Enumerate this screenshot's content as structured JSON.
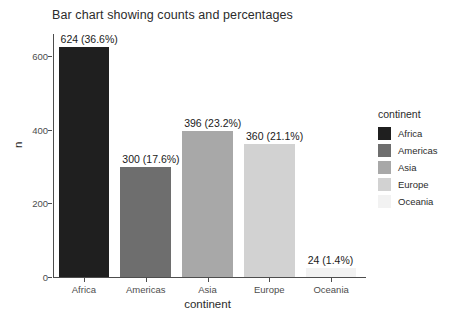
{
  "chart_data": {
    "type": "bar",
    "title": "Bar chart showing counts and percentages",
    "xlabel": "continent",
    "ylabel": "n",
    "categories": [
      "Africa",
      "Americas",
      "Asia",
      "Europe",
      "Oceania"
    ],
    "values": [
      624,
      300,
      396,
      360,
      24
    ],
    "percentages": [
      "36.6%",
      "17.6%",
      "23.2%",
      "21.1%",
      "1.4%"
    ],
    "data_labels": [
      "624 (36.6%)",
      "300 (17.6%)",
      "396 (23.2%)",
      "360 (21.1%)",
      "24 (1.4%)"
    ],
    "ylim": [
      0,
      660
    ],
    "yticks": [
      0,
      200,
      400,
      600
    ],
    "ytick_labels": [
      "0",
      "200",
      "400",
      "600"
    ],
    "grid": false,
    "legend_position": "right",
    "colors": [
      "#1f1f1f",
      "#6e6e6e",
      "#a8a8a8",
      "#d2d2d2",
      "#f2f2f2"
    ],
    "bars": [
      {
        "category": "Africa",
        "value": 624,
        "percent": "36.6%",
        "label": "624 (36.6%)",
        "color": "#1f1f1f"
      },
      {
        "category": "Americas",
        "value": 300,
        "percent": "17.6%",
        "label": "300 (17.6%)",
        "color": "#6e6e6e"
      },
      {
        "category": "Asia",
        "value": 396,
        "percent": "23.2%",
        "label": "396 (23.2%)",
        "color": "#a8a8a8"
      },
      {
        "category": "Europe",
        "value": 360,
        "percent": "21.1%",
        "label": "360 (21.1%)",
        "color": "#d2d2d2"
      },
      {
        "category": "Oceania",
        "value": 24,
        "percent": "1.4%",
        "label": "24 (1.4%)",
        "color": "#f2f2f2"
      }
    ]
  },
  "legend": {
    "title": "continent",
    "items": [
      {
        "label": "Africa",
        "color": "#1f1f1f"
      },
      {
        "label": "Americas",
        "color": "#6e6e6e"
      },
      {
        "label": "Asia",
        "color": "#a8a8a8"
      },
      {
        "label": "Europe",
        "color": "#d2d2d2"
      },
      {
        "label": "Oceania",
        "color": "#f2f2f2"
      }
    ]
  }
}
